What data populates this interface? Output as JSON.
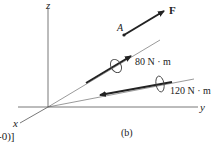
{
  "figure": {
    "caption": "(b)",
    "edge_fragment": "-0)]",
    "axes": {
      "x": "x",
      "y": "y",
      "z": "z"
    },
    "point": "A",
    "force": "F",
    "couples": [
      {
        "label": "80 N · m"
      },
      {
        "label": "120 N · m"
      }
    ]
  }
}
